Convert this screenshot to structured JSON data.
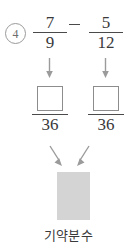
{
  "problem": {
    "number_label": "4",
    "expression": {
      "left_fraction": {
        "numerator": "7",
        "denominator": "9"
      },
      "operator": "−",
      "right_fraction": {
        "numerator": "5",
        "denominator": "12"
      }
    },
    "converted": {
      "left_fraction": {
        "numerator": "",
        "denominator": "36"
      },
      "right_fraction": {
        "numerator": "",
        "denominator": "36"
      }
    },
    "result_placeholder": "",
    "caption": "기약분수",
    "colors": {
      "ink": "#3a3a3a",
      "rule": "#4a4a4a",
      "box_border": "#8d8d8d",
      "result_fill": "#d4d4d4",
      "circle_border": "#9a9a9a",
      "arrow": "#9b9b9b",
      "background": "#ffffff"
    },
    "icons": {
      "arrow_down": "arrow-down-icon",
      "arrow_down_right": "arrow-down-right-icon",
      "arrow_down_left": "arrow-down-left-icon"
    }
  }
}
